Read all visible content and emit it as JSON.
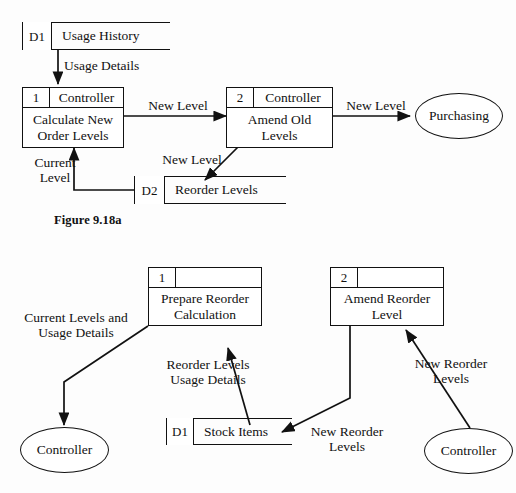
{
  "figure": {
    "caption": "Figure 9.18a"
  },
  "diagram_top": {
    "stores": [
      {
        "id": "D1",
        "name": "Usage History"
      },
      {
        "id": "D2",
        "name": "Reorder Levels"
      }
    ],
    "processes": [
      {
        "id": "1",
        "actor": "Controller",
        "name": "Calculate New\nOrder Levels"
      },
      {
        "id": "2",
        "actor": "Controller",
        "name": "Amend Old Levels"
      }
    ],
    "entities": [
      {
        "name": "Purchasing"
      }
    ],
    "flows": [
      {
        "label": "Usage Details",
        "from": "D1",
        "to": "1"
      },
      {
        "label": "New Level",
        "from": "1",
        "to": "2"
      },
      {
        "label": "New Level",
        "from": "2",
        "to": "Purchasing"
      },
      {
        "label": "New Level",
        "from": "2",
        "to": "D2"
      },
      {
        "label": "Current\nLevel",
        "from": "D2",
        "to": "1"
      }
    ]
  },
  "diagram_bottom": {
    "stores": [
      {
        "id": "D1",
        "name": "Stock Items"
      }
    ],
    "processes": [
      {
        "id": "1",
        "actor": "",
        "name": "Prepare Reorder\nCalculation"
      },
      {
        "id": "2",
        "actor": "",
        "name": "Amend Reorder\nLevel"
      }
    ],
    "entities": [
      {
        "name": "Controller"
      },
      {
        "name": "Controller"
      }
    ],
    "flows": [
      {
        "label": "Current Levels and\nUsage Details",
        "from": "1",
        "to": "Controller-left"
      },
      {
        "label": "Reorder Levels\nUsage Details",
        "from": "D1",
        "to": "1"
      },
      {
        "label": "New Reorder\nLevels",
        "from": "2",
        "to": "D1"
      },
      {
        "label": "New Reorder\nLevels",
        "from": "Controller-right",
        "to": "2"
      }
    ]
  },
  "colors": {
    "ink": "#111111",
    "page": "#fdfdfd"
  }
}
